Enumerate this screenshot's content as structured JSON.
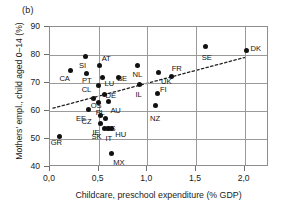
{
  "figure": {
    "panel_tag": "(b)",
    "xlabel": "Childcare, preschool expenditure (% GDP)",
    "ylabel": "Mothers' empl., child aged 0–14 (%)",
    "marker_color": "#111111",
    "grid_color": "#9a9a9a",
    "axis_color": "#8d8d8d",
    "trend_color": "#222222"
  },
  "chart_data": {
    "type": "scatter",
    "title": "(b)",
    "xlabel": "Childcare, preschool expenditure (% GDP)",
    "ylabel": "Mothers' empl., child aged 0–14 (%)",
    "xlim": [
      0.0,
      2.25
    ],
    "ylim": [
      40,
      90
    ],
    "xticks": [
      0.0,
      0.5,
      1.0,
      1.5,
      2.0
    ],
    "xticklabels": [
      "0,0",
      "0,5",
      "1,0",
      "1,5",
      "2,0"
    ],
    "yticks": [
      40,
      50,
      60,
      70,
      80,
      90
    ],
    "yticklabels": [
      "40",
      "50",
      "60",
      "70",
      "80",
      "90"
    ],
    "grid": true,
    "legend": null,
    "trendline": {
      "label": "dotted linear fit",
      "style": "dotted",
      "x0": 0.03,
      "y0": 61.0,
      "x1": 2.02,
      "y1": 79.3
    },
    "points": [
      {
        "label": "GR",
        "x": 0.1,
        "y": 50.9,
        "lx": -8,
        "ly": 7
      },
      {
        "label": "CA",
        "x": 0.21,
        "y": 74.3,
        "lx": -10,
        "ly": 8
      },
      {
        "label": "SI",
        "x": 0.36,
        "y": 79.4,
        "lx": -5,
        "ly": 9
      },
      {
        "label": "PT",
        "x": 0.37,
        "y": 73.4,
        "lx": -3,
        "ly": 8
      },
      {
        "label": "CL",
        "x": 0.5,
        "y": 69.2,
        "lx": -16,
        "ly": 5
      },
      {
        "label": "AT",
        "x": 0.51,
        "y": 76.1,
        "lx": 3,
        "ly": -7
      },
      {
        "label": "LU",
        "x": 0.54,
        "y": 71.8,
        "lx": 3,
        "ly": 6
      },
      {
        "label": "DE",
        "x": 0.56,
        "y": 65.8,
        "lx": 2,
        "ly": 1
      },
      {
        "label": "BE",
        "x": 0.7,
        "y": 71.9,
        "lx": 0,
        "ly": 1
      },
      {
        "label": "EE",
        "x": 0.4,
        "y": 60.6,
        "lx": -12,
        "ly": 10
      },
      {
        "label": "OS",
        "x": 0.45,
        "y": 64.5,
        "lx": -2,
        "ly": 8
      },
      {
        "label": "PL",
        "x": 0.5,
        "y": 62.9,
        "lx": -2,
        "ly": 10
      },
      {
        "label": "AU",
        "x": 0.6,
        "y": 63.3,
        "lx": 3,
        "ly": 9
      },
      {
        "label": "CZ",
        "x": 0.52,
        "y": 58.4,
        "lx": -18,
        "ly": 7
      },
      {
        "label": "IE",
        "x": 0.52,
        "y": 55.5,
        "lx": -7,
        "ly": 9
      },
      {
        "label": "ES",
        "x": 0.57,
        "y": 57.3,
        "lx": 1,
        "ly": 10
      },
      {
        "label": "SK",
        "x": 0.56,
        "y": 53.9,
        "lx": -12,
        "ly": 9
      },
      {
        "label": "IT",
        "x": 0.6,
        "y": 53.8,
        "lx": -2,
        "ly": 11
      },
      {
        "label": "HU",
        "x": 0.63,
        "y": 53.9,
        "lx": 5,
        "ly": 7
      },
      {
        "label": "MX",
        "x": 0.63,
        "y": 44.9,
        "lx": 3,
        "ly": 10
      },
      {
        "label": "NL",
        "x": 0.9,
        "y": 76.4,
        "lx": -4,
        "ly": 10
      },
      {
        "label": "IL",
        "x": 0.92,
        "y": 69.3,
        "lx": -3,
        "ly": 10
      },
      {
        "label": "NZ",
        "x": 1.08,
        "y": 62.0,
        "lx": -4,
        "ly": 14
      },
      {
        "label": "FI",
        "x": 1.1,
        "y": 66.4,
        "lx": 4,
        "ly": -3
      },
      {
        "label": "UK",
        "x": 1.11,
        "y": 73.6,
        "lx": 4,
        "ly": 9
      },
      {
        "label": "FR",
        "x": 1.25,
        "y": 72.4,
        "lx": 1,
        "ly": -7
      },
      {
        "label": "SE",
        "x": 1.6,
        "y": 83.0,
        "lx": -3,
        "ly": 11
      },
      {
        "label": "DK",
        "x": 2.02,
        "y": 81.5,
        "lx": 5,
        "ly": -2
      }
    ]
  }
}
